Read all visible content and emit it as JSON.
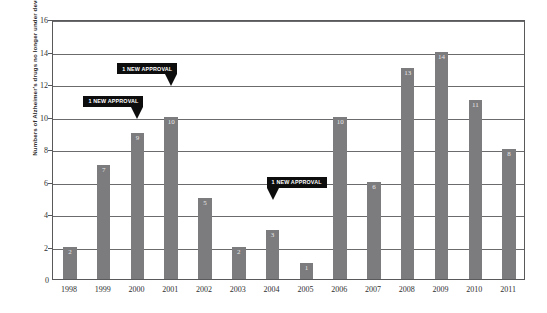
{
  "chart_data": {
    "type": "bar",
    "title": "",
    "xlabel": "",
    "ylabel": "Numbers of Alzheimer's drugs no longer under development",
    "categories": [
      "1998",
      "1999",
      "2000",
      "2001",
      "2002",
      "2003",
      "2004",
      "2005",
      "2006",
      "2007",
      "2008",
      "2009",
      "2010",
      "2011"
    ],
    "values": [
      2,
      7,
      9,
      10,
      5,
      2,
      3,
      1,
      10,
      6,
      13,
      14,
      11,
      8
    ],
    "ylim": [
      0,
      16
    ],
    "ytick_labels": [
      "0",
      "2",
      "4",
      "6",
      "8",
      "10",
      "12",
      "14",
      "16"
    ],
    "ytick_values": [
      0,
      2,
      4,
      6,
      8,
      10,
      12,
      14,
      16
    ],
    "grid": true,
    "legend": "none",
    "bar_color": "#7c7b7d",
    "axis_color": "#59585a",
    "value_label_color": "#e9e9e9",
    "annotations": [
      {
        "text": "1 NEW APPROVAL",
        "category": "2000",
        "value": 10,
        "tail_side": "right"
      },
      {
        "text": "1 NEW APPROVAL",
        "category": "2001",
        "value": 12,
        "tail_side": "right"
      },
      {
        "text": "1 NEW APPROVAL",
        "category": "2004",
        "value": 5,
        "tail_side": "left"
      }
    ],
    "annotation_bg": "#0d0d0d",
    "annotation_text_color": "#ffffff"
  }
}
